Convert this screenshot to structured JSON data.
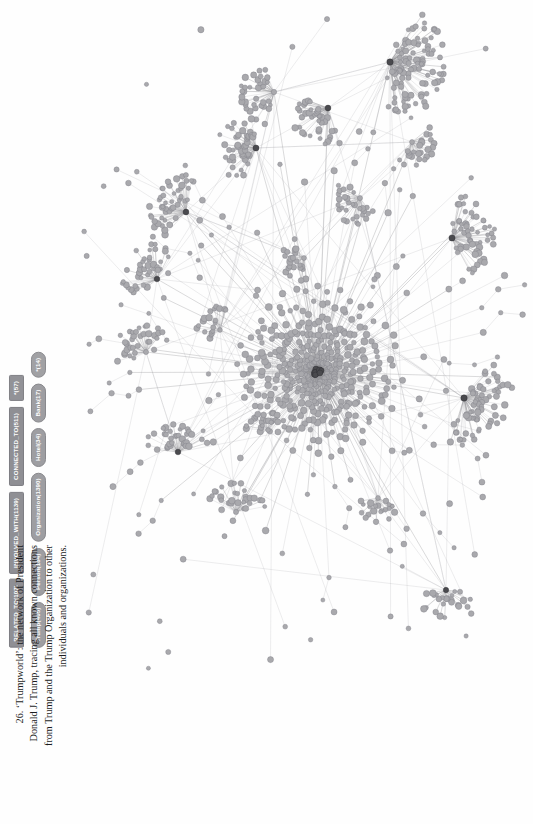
{
  "figure": {
    "caption": "26. ‘Trumpworld’: the network of President Donald J. Trump, tracing all known connections from Trump and the Trump Organization to other individuals and organizations.",
    "caption_number": "26",
    "caption_title": "‘Trumpworld’"
  },
  "legend": {
    "node_labels": [
      {
        "name": "node-badge-trump",
        "text": "Trump(405)",
        "label": "Trump",
        "count": 405,
        "color": "#9e9ea2",
        "clipped": false
      },
      {
        "name": "node-badge-person",
        "text": "Person(184)",
        "label": "Person",
        "count": 184,
        "color": "#9e9ea2",
        "clipped": false
      },
      {
        "name": "node-badge-organization",
        "text": "Organization(1390)",
        "label": "Organization",
        "count": 1390,
        "color": "#9e9ea2",
        "clipped": false
      },
      {
        "name": "node-badge-hotel",
        "text": "Hotel(34)",
        "label": "Hotel",
        "count": 34,
        "color": "#9e9ea2",
        "clipped": false
      },
      {
        "name": "node-badge-bank",
        "text": "Bank(17)",
        "label": "Bank",
        "count": 17,
        "color": "#9e9ea2",
        "clipped": false
      },
      {
        "name": "node-badge-clipped",
        "text": "*(14)",
        "label": "",
        "count": 14,
        "color": "#9e9ea2",
        "clipped": true
      }
    ],
    "relationship_types": [
      {
        "name": "rel-badge-related-to",
        "text": "RELATED_TO(107)",
        "label": "RELATED_TO",
        "count": 107,
        "color": "#8f8f94",
        "clipped": false
      },
      {
        "name": "rel-badge-involved-with",
        "text": "INVOLVED_WITH(1139)",
        "label": "INVOLVED_WITH",
        "count": 1139,
        "color": "#8f8f94",
        "clipped": false
      },
      {
        "name": "rel-badge-connected-to",
        "text": "CONNECTED_TO(511)",
        "label": "CONNECTED_TO",
        "count": 511,
        "color": "#8f8f94",
        "clipped": false
      },
      {
        "name": "rel-badge-clipped",
        "text": "*(57)",
        "label": "",
        "count": 57,
        "color": "#8f8f94",
        "clipped": true
      }
    ]
  },
  "graph": {
    "node_fill": "#a9a9ad",
    "node_stroke": "#7e7e84",
    "edge_color": "#8e8e92",
    "hub_color": "#4a4a4e",
    "background": "#ffffff",
    "description": "Force-directed network graph with one very dense central hub and numerous radial satellite clusters"
  }
}
